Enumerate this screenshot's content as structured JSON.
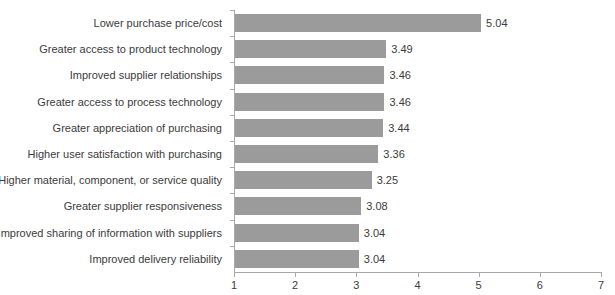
{
  "chart_data": {
    "type": "bar",
    "orientation": "horizontal",
    "title": "",
    "subtitle": "",
    "xlabel": "",
    "ylabel": "",
    "xlim": [
      1,
      7
    ],
    "xticks": [
      "1",
      "2",
      "3",
      "4",
      "5",
      "6",
      "7"
    ],
    "grid": false,
    "legend": "none",
    "bar_color": "#9b9b9b",
    "text_color": "#3b3b3b",
    "axis_color": "#a8a8a8",
    "categories": [
      "Lower purchase price/cost",
      "Greater access to product technology",
      "Improved supplier relationships",
      "Greater access to process technology",
      "Greater appreciation of purchasing",
      "Higher user satisfaction with purchasing",
      "Higher material, component, or service quality",
      "Greater supplier responsiveness",
      "Improved sharing of information with suppliers",
      "Improved delivery reliability"
    ],
    "values": [
      5.04,
      3.49,
      3.46,
      3.46,
      3.44,
      3.36,
      3.25,
      3.08,
      3.04,
      3.04
    ],
    "value_labels": [
      "5.04",
      "3.49",
      "3.46",
      "3.46",
      "3.44",
      "3.36",
      "3.25",
      "3.08",
      "3.04",
      "3.04"
    ]
  }
}
